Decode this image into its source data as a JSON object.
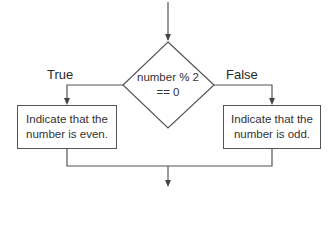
{
  "decision": {
    "line1": "number % 2",
    "line2": "== 0"
  },
  "branches": {
    "true_label": "True",
    "false_label": "False"
  },
  "true_box": {
    "line1": "Indicate that the",
    "line2": "number is even."
  },
  "false_box": {
    "line1": "Indicate that the",
    "line2": "number is odd."
  },
  "colors": {
    "line": "#555555",
    "text": "#2a2a2a",
    "background": "#ffffff"
  }
}
